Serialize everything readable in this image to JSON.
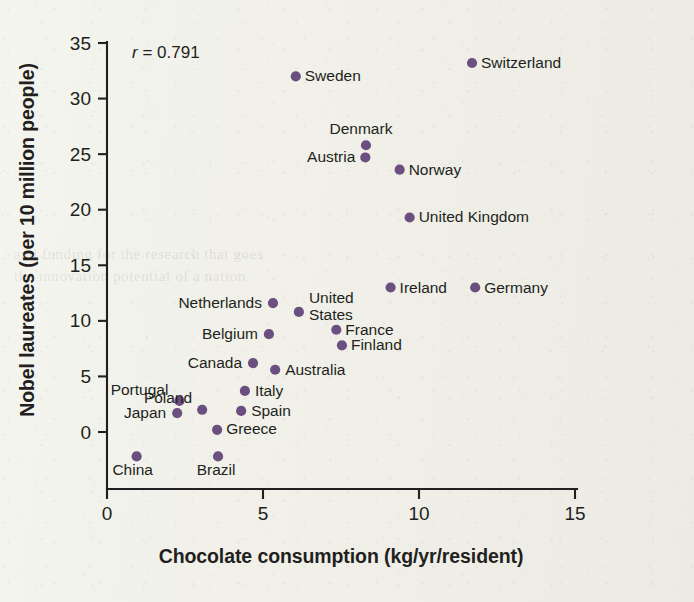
{
  "figure": {
    "background_color": "#f1f1ea",
    "point_color": "#6b4f81",
    "axis_color": "#231f20"
  },
  "ghost_text": [
    {
      "text": "and funding for the research that goes",
      "x": 14,
      "y": 246
    },
    {
      "text": "the innovation potential of a nation",
      "x": 14,
      "y": 268
    }
  ],
  "annotation": {
    "name": "correlation-annotation",
    "symbol": "r",
    "equals": " = ",
    "value": "0.791",
    "full": "r = 0.791",
    "x": 132,
    "y": 58
  },
  "chart_data": {
    "type": "scatter",
    "title": "",
    "subtitle": "",
    "xlabel": "Chocolate consumption (kg/yr/resident)",
    "ylabel": "Nobel laureates (per 10 million people)",
    "xlim": [
      0,
      15
    ],
    "ylim": [
      0,
      35
    ],
    "xticks": [
      0,
      5,
      10,
      15
    ],
    "yticks": [
      0,
      5,
      10,
      15,
      20,
      25,
      30,
      35
    ],
    "xtick_labels": [
      "0",
      "5",
      "10",
      "15"
    ],
    "ytick_labels": [
      "0",
      "5",
      "10",
      "15",
      "20",
      "25",
      "30",
      "35"
    ],
    "grid": false,
    "legend": false,
    "annotations": [
      "r = 0.791"
    ],
    "correlation_r": 0.791,
    "point_label_key": "country",
    "points": [
      {
        "country": "China",
        "x": 0.95,
        "y": -2.2,
        "label_dx": -4,
        "label_dy": 19,
        "label_anchor": "middle"
      },
      {
        "country": "Japan",
        "x": 2.25,
        "y": 1.7,
        "label_dx": -11,
        "label_dy": 5,
        "label_anchor": "end"
      },
      {
        "country": "Portugal",
        "x": 2.32,
        "y": 2.8,
        "label_dx": -11,
        "label_dy": -6,
        "label_anchor": "end"
      },
      {
        "country": "Poland",
        "x": 3.05,
        "y": 2.0,
        "label_dx": -10,
        "label_dy": -7,
        "label_anchor": "end"
      },
      {
        "country": "Greece",
        "x": 3.53,
        "y": 0.2,
        "label_dx": 9,
        "label_dy": 4,
        "label_anchor": "start"
      },
      {
        "country": "Brazil",
        "x": 3.56,
        "y": -2.2,
        "label_dx": -2,
        "label_dy": 19,
        "label_anchor": "middle"
      },
      {
        "country": "Spain",
        "x": 4.3,
        "y": 1.9,
        "label_dx": 10,
        "label_dy": 5,
        "label_anchor": "start"
      },
      {
        "country": "Italy",
        "x": 4.42,
        "y": 3.7,
        "label_dx": 10,
        "label_dy": 5,
        "label_anchor": "start"
      },
      {
        "country": "Canada",
        "x": 4.68,
        "y": 6.2,
        "label_dx": -11,
        "label_dy": 5,
        "label_anchor": "end"
      },
      {
        "country": "Australia",
        "x": 5.39,
        "y": 5.6,
        "label_dx": 10,
        "label_dy": 5,
        "label_anchor": "start"
      },
      {
        "country": "Belgium",
        "x": 5.19,
        "y": 8.8,
        "label_dx": -11,
        "label_dy": 5,
        "label_anchor": "end"
      },
      {
        "country": "Netherlands",
        "x": 5.32,
        "y": 11.6,
        "label_dx": -11,
        "label_dy": 5,
        "label_anchor": "end"
      },
      {
        "country": "United States",
        "x": 6.15,
        "y": 10.8,
        "label_dx": 10,
        "label_dy": -9,
        "label_anchor": "start",
        "label_lines": [
          "United",
          "States"
        ]
      },
      {
        "country": "France",
        "x": 7.35,
        "y": 9.2,
        "label_dx": 9,
        "label_dy": 5,
        "label_anchor": "start"
      },
      {
        "country": "Finland",
        "x": 7.53,
        "y": 7.8,
        "label_dx": 9,
        "label_dy": 5,
        "label_anchor": "start"
      },
      {
        "country": "Ireland",
        "x": 9.09,
        "y": 13.0,
        "label_dx": 9,
        "label_dy": 5,
        "label_anchor": "start"
      },
      {
        "country": "Germany",
        "x": 11.8,
        "y": 13.0,
        "label_dx": 9,
        "label_dy": 5,
        "label_anchor": "start"
      },
      {
        "country": "United Kingdom",
        "x": 9.7,
        "y": 19.3,
        "label_dx": 9,
        "label_dy": 5,
        "label_anchor": "start"
      },
      {
        "country": "Norway",
        "x": 9.38,
        "y": 23.6,
        "label_dx": 9,
        "label_dy": 5,
        "label_anchor": "start"
      },
      {
        "country": "Austria",
        "x": 8.28,
        "y": 24.7,
        "label_dx": -10,
        "label_dy": 5,
        "label_anchor": "end"
      },
      {
        "country": "Denmark",
        "x": 8.3,
        "y": 25.8,
        "label_dx": -5,
        "label_dy": -11,
        "label_anchor": "middle"
      },
      {
        "country": "Sweden",
        "x": 6.05,
        "y": 32.0,
        "label_dx": 9,
        "label_dy": 5,
        "label_anchor": "start"
      },
      {
        "country": "Switzerland",
        "x": 11.7,
        "y": 33.2,
        "label_dx": 9,
        "label_dy": 5,
        "label_anchor": "start"
      }
    ]
  }
}
